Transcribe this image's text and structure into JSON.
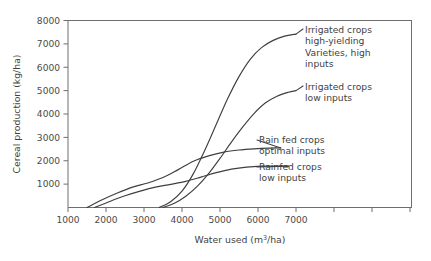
{
  "chart_data": {
    "type": "line",
    "title": "",
    "xlabel": "Water used (m3/ha)",
    "xlabel_parts": {
      "pre": "Water used (m",
      "sup": "3",
      "post": "/ha)"
    },
    "ylabel": "Cereal production (kg/ha)",
    "xlim": [
      500,
      10000
    ],
    "ylim": [
      0,
      8000
    ],
    "grid": false,
    "legend_position": "inline-right-labels",
    "x_ticks": [
      1000,
      2000,
      3000,
      4000,
      5000,
      6000,
      7000,
      8000,
      9000,
      10000
    ],
    "x_tick_labels": [
      "1000",
      "2000",
      "3000",
      "4000",
      "5000",
      "6000",
      "7000",
      "",
      "",
      ""
    ],
    "y_ticks": [
      1000,
      2000,
      3000,
      4000,
      5000,
      6000,
      7000,
      8000
    ],
    "y_tick_labels": [
      "1000",
      "2000",
      "3000",
      "4000",
      "5000",
      "6000",
      "7000",
      "8000"
    ],
    "series": [
      {
        "name": "Irrigated crops high-yielding Varieties, high inputs",
        "label_lines": [
          "Irrigated crops",
          "high-yielding",
          "Varieties, high",
          "inputs"
        ],
        "x": [
          3400,
          3700,
          4000,
          4300,
          4600,
          4900,
          5200,
          5500,
          5800,
          6100,
          6400,
          6700,
          7000
        ],
        "y": [
          0,
          250,
          700,
          1450,
          2450,
          3550,
          4650,
          5600,
          6350,
          6850,
          7150,
          7330,
          7420
        ]
      },
      {
        "name": "Irrigated crops low inputs",
        "label_lines": [
          "Irrigated crops",
          "low inputs"
        ],
        "x": [
          3500,
          3800,
          4100,
          4400,
          4700,
          5000,
          5300,
          5600,
          5900,
          6200,
          6500,
          6800,
          7000
        ],
        "y": [
          0,
          180,
          480,
          900,
          1450,
          2100,
          2800,
          3450,
          4030,
          4480,
          4760,
          4930,
          5000
        ]
      },
      {
        "name": "Rain fed crops optimal inputs",
        "label_lines": [
          "Rain fed crops",
          "optimal inputs"
        ],
        "x": [
          1500,
          1900,
          2300,
          2700,
          3100,
          3500,
          3900,
          4300,
          4700,
          5100,
          5500,
          5900,
          6300,
          6600
        ],
        "y": [
          0,
          330,
          620,
          870,
          1050,
          1280,
          1620,
          1980,
          2210,
          2370,
          2460,
          2510,
          2540,
          2550
        ]
      },
      {
        "name": "Rainfed crops low inputs",
        "label_lines": [
          "Rainfed crops",
          "low inputs"
        ],
        "x": [
          1700,
          2100,
          2500,
          2900,
          3300,
          3700,
          4100,
          4500,
          4900,
          5300,
          5700,
          6100,
          6500,
          6800
        ],
        "y": [
          0,
          260,
          500,
          700,
          870,
          990,
          1120,
          1300,
          1490,
          1640,
          1730,
          1770,
          1775,
          1770
        ]
      }
    ]
  },
  "axes": {
    "y_title": "Cereal production (kg/ha)"
  },
  "colors": {
    "curve": "#3f3f3f",
    "axis": "#6e6e6e",
    "text": "#3f3f3f",
    "background": "#ffffff"
  }
}
